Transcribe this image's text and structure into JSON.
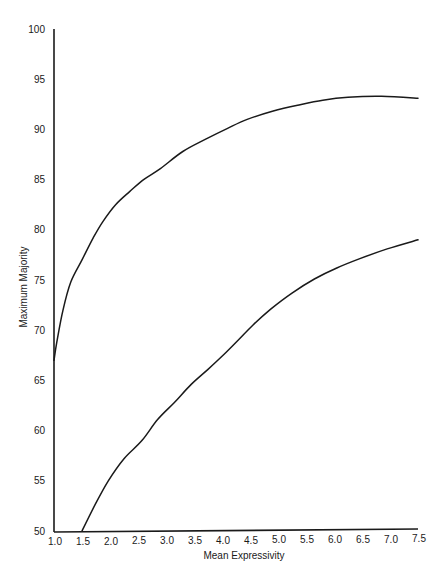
{
  "chart_data": {
    "type": "line",
    "title": "",
    "xlabel": "Mean Expressivity",
    "ylabel": "Maximum Majority",
    "xlim": [
      1.0,
      7.5
    ],
    "ylim": [
      50,
      100
    ],
    "grid": false,
    "legend": null,
    "x_ticks": [
      "1.0",
      "1.5",
      "2.0",
      "2.5",
      "3.0",
      "3.5",
      "4.0",
      "4.5",
      "5.0",
      "5.5",
      "6.0",
      "6.5",
      "7.0",
      "7.5"
    ],
    "y_ticks": [
      "50",
      "55",
      "60",
      "65",
      "70",
      "75",
      "80",
      "85",
      "90",
      "95",
      "100"
    ],
    "series": [
      {
        "name": "upper curve",
        "x": [
          1.0,
          1.05,
          1.16,
          1.3,
          1.5,
          1.7,
          1.87,
          2.1,
          2.35,
          2.6,
          2.9,
          3.3,
          3.7,
          4.1,
          4.45,
          4.9,
          5.35,
          5.8,
          6.25,
          6.85,
          7.5
        ],
        "y": [
          67.0,
          68.8,
          72.0,
          74.8,
          77.0,
          79.2,
          80.8,
          82.5,
          83.8,
          85.0,
          86.1,
          87.8,
          89.0,
          90.1,
          91.0,
          91.8,
          92.4,
          92.9,
          93.2,
          93.3,
          93.1
        ]
      },
      {
        "name": "lower curve",
        "x": [
          1.5,
          1.75,
          1.97,
          2.25,
          2.57,
          2.85,
          3.15,
          3.45,
          3.75,
          4.0,
          4.27,
          4.55,
          4.87,
          5.25,
          5.65,
          6.05,
          6.45,
          6.95,
          7.5
        ],
        "y": [
          50.0,
          52.8,
          55.0,
          57.2,
          59.0,
          61.1,
          62.8,
          64.6,
          66.1,
          67.4,
          68.9,
          70.5,
          72.1,
          73.7,
          75.1,
          76.2,
          77.1,
          78.1,
          79.0
        ]
      }
    ]
  }
}
